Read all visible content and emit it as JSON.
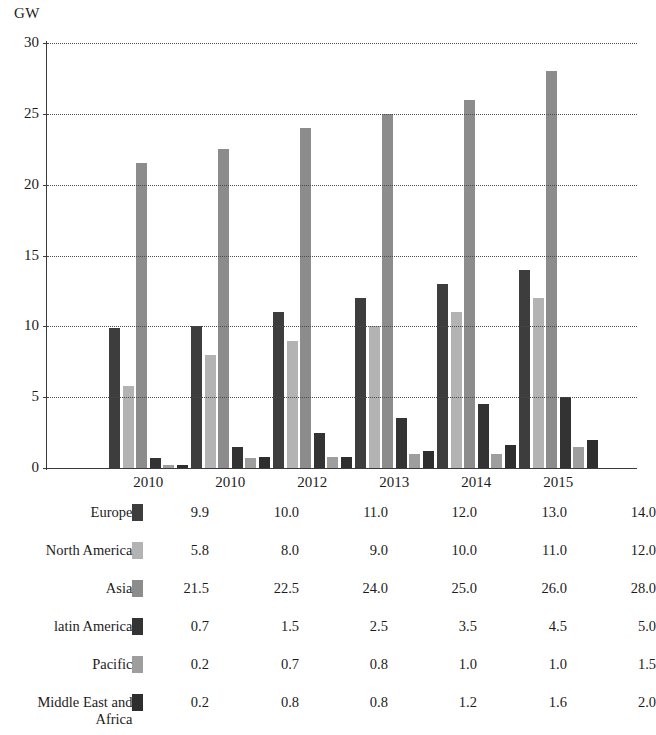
{
  "chart_data": {
    "type": "bar",
    "title": "",
    "subtitle": "",
    "xlabel": "",
    "ylabel": "GW",
    "unit_label": "GW",
    "categories": [
      "2010",
      "2010",
      "2012",
      "2013",
      "2014",
      "2015"
    ],
    "ylim": [
      0,
      30
    ],
    "yticks": [
      0,
      5,
      10,
      15,
      20,
      25,
      30
    ],
    "ytick_labels": [
      "0",
      "5",
      "10",
      "15",
      "20",
      "25",
      "30"
    ],
    "grid": true,
    "grid_style": "dotted-horizontal",
    "legend_position": "table-below",
    "series": [
      {
        "name": "Europe",
        "color": "#3d3d3d",
        "values": [
          9.9,
          10.0,
          11.0,
          12.0,
          13.0,
          14.0
        ]
      },
      {
        "name": "North America",
        "color": "#b3b3b3",
        "values": [
          5.8,
          8.0,
          9.0,
          10.0,
          11.0,
          12.0
        ]
      },
      {
        "name": "Asia",
        "color": "#8c8c8c",
        "values": [
          21.5,
          22.5,
          24.0,
          25.0,
          26.0,
          28.0
        ]
      },
      {
        "name": "latin America",
        "color": "#333333",
        "values": [
          0.7,
          1.5,
          2.5,
          3.5,
          4.5,
          5.0
        ]
      },
      {
        "name": "Pacific",
        "color": "#9e9e9e",
        "values": [
          0.2,
          0.7,
          0.8,
          1.0,
          1.0,
          1.5
        ]
      },
      {
        "name": "Middle East and\nAfrica",
        "color": "#2e2e2e",
        "values": [
          0.2,
          0.8,
          0.8,
          1.2,
          1.6,
          2.0
        ]
      }
    ]
  },
  "table": {
    "rows": [
      {
        "label": "Europe",
        "swatch_color": "#3d3d3d",
        "values": [
          "9.9",
          "10.0",
          "11.0",
          "12.0",
          "13.0",
          "14.0"
        ]
      },
      {
        "label": "North America",
        "swatch_color": "#b3b3b3",
        "values": [
          "5.8",
          "8.0",
          "9.0",
          "10.0",
          "11.0",
          "12.0"
        ]
      },
      {
        "label": "Asia",
        "swatch_color": "#8c8c8c",
        "values": [
          "21.5",
          "22.5",
          "24.0",
          "25.0",
          "26.0",
          "28.0"
        ]
      },
      {
        "label": "latin America",
        "swatch_color": "#333333",
        "values": [
          "0.7",
          "1.5",
          "2.5",
          "3.5",
          "4.5",
          "5.0"
        ]
      },
      {
        "label": "Pacific",
        "swatch_color": "#9e9e9e",
        "values": [
          "0.2",
          "0.7",
          "0.8",
          "1.0",
          "1.0",
          "1.5"
        ]
      },
      {
        "label": "Middle East and\nAfrica",
        "swatch_color": "#2e2e2e",
        "values": [
          "0.2",
          "0.8",
          "0.8",
          "1.2",
          "1.6",
          "2.0"
        ]
      }
    ]
  },
  "colors": {
    "axis": "#3b3b3b",
    "grid": "#4a4a4a",
    "text": "#1c1c1c",
    "background": "#ffffff"
  }
}
